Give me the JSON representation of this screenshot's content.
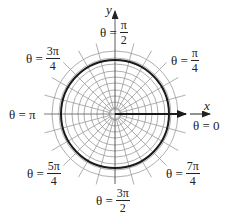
{
  "diagram": {
    "title": "",
    "type": "polar grid",
    "center": {
      "x": 115,
      "y": 114
    },
    "colors": {
      "grid": "#9a9a9a",
      "curve": "#1a1a1a",
      "axis": "#333333",
      "text": "#222222"
    },
    "grid": {
      "circle_radii": [
        6,
        12,
        18,
        24,
        31,
        37,
        43,
        50,
        56,
        63
      ],
      "spoke_count": 24,
      "spoke_inner_radius": 4,
      "spoke_outer_radius": 73
    },
    "bold_circle": {
      "radius": 54
    },
    "axes": {
      "x_label": "x",
      "y_label": "y"
    },
    "polar_vector": {
      "from_r": 0,
      "to_r": 71,
      "angle": 0
    }
  },
  "labels": {
    "theta_0": {
      "lhs": "θ = 0",
      "num": "",
      "den": ""
    },
    "theta_pi_4": {
      "lhs": "θ =",
      "num": "π",
      "den": "4"
    },
    "theta_pi_2": {
      "lhs": "θ =",
      "num": "π",
      "den": "2"
    },
    "theta_3pi_4": {
      "lhs": "θ =",
      "num": "3π",
      "den": "4"
    },
    "theta_pi": {
      "lhs": "θ = π",
      "num": "",
      "den": ""
    },
    "theta_5pi_4": {
      "lhs": "θ =",
      "num": "5π",
      "den": "4"
    },
    "theta_3pi_2": {
      "lhs": "θ =",
      "num": "3π",
      "den": "2"
    },
    "theta_7pi_4": {
      "lhs": "θ =",
      "num": "7π",
      "den": "4"
    }
  }
}
